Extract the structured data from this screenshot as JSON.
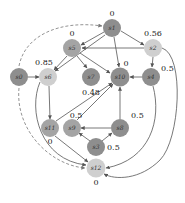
{
  "diagram": {
    "type": "state-transition-graph",
    "colors": {
      "dark": "#8e8e8e",
      "medium": "#a4a4a4",
      "light": "#cfcfcf",
      "edge": "#555555",
      "dashed_edge": "#777777"
    },
    "nodes": [
      {
        "id": "s0",
        "label": "s0",
        "sub": "0",
        "x": 19,
        "y": 77,
        "shade": "dark",
        "value": ""
      },
      {
        "id": "s1",
        "label": "s1",
        "sub": "1",
        "x": 112,
        "y": 28,
        "shade": "dark",
        "value": "0"
      },
      {
        "id": "s2",
        "label": "s2",
        "sub": "2",
        "x": 153,
        "y": 48,
        "shade": "light",
        "value": "0.56"
      },
      {
        "id": "s3",
        "label": "s3",
        "sub": "3",
        "x": 96,
        "y": 147,
        "shade": "dark",
        "value": "0.5"
      },
      {
        "id": "s4",
        "label": "s4",
        "sub": "4",
        "x": 151,
        "y": 77,
        "shade": "dark",
        "value": "0.5"
      },
      {
        "id": "s5",
        "label": "s5",
        "sub": "5",
        "x": 72,
        "y": 48,
        "shade": "medium",
        "value": "0"
      },
      {
        "id": "s6",
        "label": "s6",
        "sub": "6",
        "x": 48,
        "y": 77,
        "shade": "light",
        "value": "0.85"
      },
      {
        "id": "s7",
        "label": "s7",
        "sub": "7",
        "x": 91,
        "y": 77,
        "shade": "dark",
        "value": "0.48"
      },
      {
        "id": "s8",
        "label": "s8",
        "sub": "8",
        "x": 120,
        "y": 128,
        "shade": "dark",
        "value": "0.5"
      },
      {
        "id": "s9",
        "label": "s9",
        "sub": "9",
        "x": 72,
        "y": 128,
        "shade": "medium",
        "value": "0.5"
      },
      {
        "id": "s10",
        "label": "s10",
        "sub": "10",
        "x": 120,
        "y": 77,
        "shade": "dark",
        "value": "0"
      },
      {
        "id": "s11",
        "label": "s11",
        "sub": "11",
        "x": 50,
        "y": 128,
        "shade": "medium",
        "value": "0"
      },
      {
        "id": "s12",
        "label": "s12",
        "sub": "12",
        "x": 96,
        "y": 168,
        "shade": "light",
        "value": "0"
      }
    ],
    "edges": [
      {
        "from": "s0",
        "to": "s6",
        "style": "solid"
      },
      {
        "from": "s0",
        "to": "s1",
        "style": "dashed"
      },
      {
        "from": "s0",
        "to": "s12",
        "style": "dashed"
      },
      {
        "from": "s1",
        "to": "s5",
        "style": "solid"
      },
      {
        "from": "s1",
        "to": "s2",
        "style": "solid"
      },
      {
        "from": "s1",
        "to": "s6",
        "style": "solid"
      },
      {
        "from": "s1",
        "to": "s10",
        "style": "solid"
      },
      {
        "from": "s2",
        "to": "s5",
        "style": "solid"
      },
      {
        "from": "s2",
        "to": "s4",
        "style": "solid"
      },
      {
        "from": "s2",
        "to": "s12",
        "style": "solid"
      },
      {
        "from": "s4",
        "to": "s10",
        "style": "solid"
      },
      {
        "from": "s4",
        "to": "s12",
        "style": "solid"
      },
      {
        "from": "s5",
        "to": "s6",
        "style": "solid"
      },
      {
        "from": "s5",
        "to": "s7",
        "style": "solid"
      },
      {
        "from": "s5",
        "to": "s10",
        "style": "solid"
      },
      {
        "from": "s6",
        "to": "s11",
        "style": "solid"
      },
      {
        "from": "s6",
        "to": "s12",
        "style": "solid"
      },
      {
        "from": "s8",
        "to": "s9",
        "style": "solid"
      },
      {
        "from": "s8",
        "to": "s10",
        "style": "solid"
      },
      {
        "from": "s9",
        "to": "s10",
        "style": "solid"
      },
      {
        "from": "s3",
        "to": "s9",
        "style": "solid"
      },
      {
        "from": "s3",
        "to": "s8",
        "style": "solid"
      },
      {
        "from": "s11",
        "to": "s10",
        "style": "solid"
      },
      {
        "from": "s11",
        "to": "s12",
        "style": "solid"
      }
    ]
  }
}
